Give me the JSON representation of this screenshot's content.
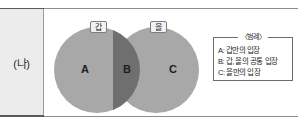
{
  "row": {
    "label": "(나)"
  },
  "diagram": {
    "type": "venn-two-set",
    "tags": [
      {
        "name": "set-a-tag",
        "label": "갑"
      },
      {
        "name": "set-b-tag",
        "label": "을"
      }
    ],
    "regions": [
      {
        "id": "A",
        "label": "A",
        "meaning": "갑만의 입장"
      },
      {
        "id": "B",
        "label": "B",
        "meaning": "갑, 을의 공통 입장"
      },
      {
        "id": "C",
        "label": "C",
        "meaning": "을만의 입장"
      }
    ],
    "colors": {
      "circle_fill": "#a8a8a8",
      "intersection_fill": "#6f6f6f",
      "label_cell_bg": "#ececec",
      "rule": "#8d8d8d"
    }
  },
  "legend": {
    "title": "〈범례〉",
    "items": [
      "A: 갑만의 입장",
      "B: 갑, 을의 공통 입장",
      "C: 을만의 입장"
    ]
  }
}
